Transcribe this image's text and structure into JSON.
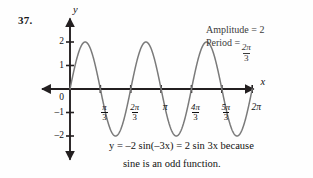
{
  "problem": {
    "number": "37."
  },
  "axes": {
    "y_name": "y",
    "x_name": "x",
    "y_ticks": [
      {
        "value": 2,
        "label": "2"
      },
      {
        "value": 1,
        "label": "1"
      },
      {
        "value": 0,
        "label": "0"
      },
      {
        "value": -1,
        "label": "–1"
      },
      {
        "value": -2,
        "label": "–2"
      }
    ],
    "x_ticks": [
      {
        "value": 1.0471975512,
        "num": "π",
        "den": "3",
        "label": "π/3"
      },
      {
        "value": 2.0943951024,
        "num": "2π",
        "den": "3",
        "label": "2π/3"
      },
      {
        "value": 3.1415926536,
        "num": "π",
        "den": "",
        "label": "π"
      },
      {
        "value": 4.1887902048,
        "num": "4π",
        "den": "3",
        "label": "4π/3"
      },
      {
        "value": 5.235987756,
        "num": "5π",
        "den": "3",
        "label": "5π/3"
      },
      {
        "value": 6.2831853072,
        "num": "2π",
        "den": "",
        "label": "2π"
      }
    ]
  },
  "annotations": {
    "amplitude_label": "Amplitude = 2",
    "amplitude_name": "Amplitude =",
    "amplitude_value": "2",
    "period_name": "Period =",
    "period_numerator": "2π",
    "period_denominator": "3",
    "period_label": "Period = 2π/3"
  },
  "caption": {
    "line1": "y = –2 sin(–3x) = 2 sin 3x because",
    "line2": "sine is an odd function."
  },
  "colors": {
    "curve": "#7a7a7a",
    "axis": "#231f20",
    "text": "#111111",
    "annotation_text": "#3b3b3b",
    "background": "#fefefe"
  },
  "chart_data": {
    "type": "line",
    "title": "",
    "subtitle": "",
    "xlabel": "x",
    "ylabel": "y",
    "equation": "y = 2 sin 3x",
    "equivalent_equation": "y = –2 sin(–3x)",
    "amplitude": 2,
    "period": 2.0943951024,
    "period_expression": "2π/3",
    "frequency_coefficient": 3,
    "cycles_shown": 3,
    "xlim": [
      -0.55,
      6.95
    ],
    "ylim": [
      -2.75,
      2.75
    ],
    "grid": false,
    "legend": false,
    "x_tick_values": [
      1.0471975512,
      2.0943951024,
      3.1415926536,
      4.1887902048,
      5.235987756,
      6.2831853072
    ],
    "x_tick_labels": [
      "π/3",
      "2π/3",
      "π",
      "4π/3",
      "5π/3",
      "2π"
    ],
    "y_tick_values": [
      2,
      1,
      0,
      -1,
      -2
    ],
    "y_tick_labels": [
      "2",
      "1",
      "0",
      "–1",
      "–2"
    ],
    "series": [
      {
        "name": "y = 2 sin 3x",
        "color": "#7a7a7a",
        "key_points": [
          {
            "x": 0.0,
            "y": 0,
            "note": "start at origin"
          },
          {
            "x": 0.5235987756,
            "y": 2,
            "note": "maximum"
          },
          {
            "x": 1.0471975512,
            "y": 0,
            "note": "zero at π/3"
          },
          {
            "x": 1.5707963268,
            "y": -2,
            "note": "minimum"
          },
          {
            "x": 2.0943951024,
            "y": 0,
            "note": "zero at 2π/3"
          },
          {
            "x": 2.617993878,
            "y": 2,
            "note": "maximum"
          },
          {
            "x": 3.1415926536,
            "y": 0,
            "note": "zero at π"
          },
          {
            "x": 3.6651914292,
            "y": -2,
            "note": "minimum"
          },
          {
            "x": 4.1887902048,
            "y": 0,
            "note": "zero at 4π/3"
          },
          {
            "x": 4.7123889804,
            "y": 2,
            "note": "maximum"
          },
          {
            "x": 5.235987756,
            "y": 0,
            "note": "zero at 5π/3"
          },
          {
            "x": 5.7595865316,
            "y": -2,
            "note": "minimum"
          },
          {
            "x": 6.2831853072,
            "y": 0,
            "note": "zero at 2π"
          }
        ]
      }
    ]
  }
}
